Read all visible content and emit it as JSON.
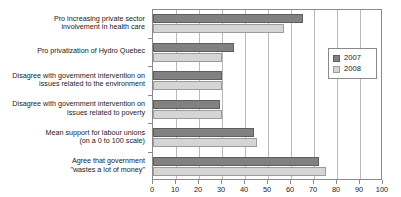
{
  "chart_data": {
    "type": "bar",
    "orientation": "horizontal",
    "title": "",
    "xlabel": "",
    "ylabel": "",
    "xlim": [
      0,
      100
    ],
    "xticks": [
      0,
      10,
      20,
      30,
      40,
      50,
      60,
      70,
      80,
      90,
      100
    ],
    "grid": true,
    "grid_axis": "x",
    "legend_position": "right",
    "categories": [
      "Pro increasing private sector\ninvolvement in health care",
      "Pro privatization of Hydro Quebec",
      "Disagree with government intervention on\nissues related to the environment",
      "Disagree with government intervention on\nissues related to poverty",
      "Mean support for labour unions\n(on a 0 to 100 scale)",
      "Agree that government\n\"wastes a lot of money\""
    ],
    "series": [
      {
        "name": "2007",
        "color": "#818181",
        "values": [
          65,
          35,
          30,
          29,
          44,
          72
        ]
      },
      {
        "name": "2008",
        "color": "#d5d5d5",
        "values": [
          57,
          30,
          30,
          30,
          45,
          75
        ]
      }
    ]
  },
  "legend": {
    "entries": [
      {
        "label": "2007"
      },
      {
        "label": "2008"
      }
    ]
  }
}
